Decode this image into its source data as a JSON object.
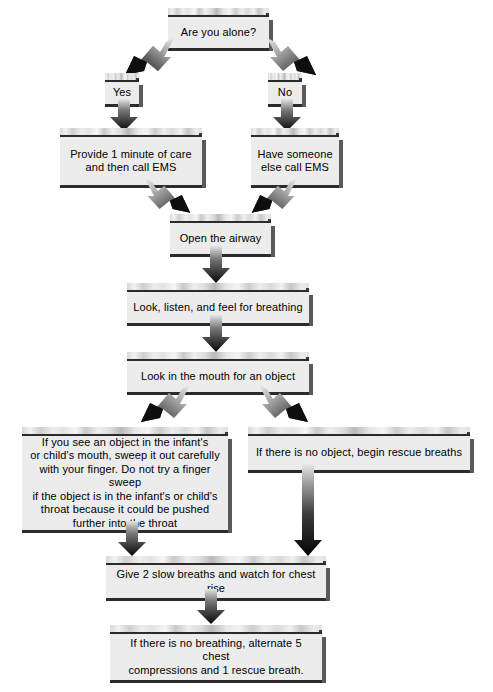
{
  "diagram": {
    "background_color": "#ffffff",
    "box_fill_color": "#ececec",
    "box_border_color": "#2b2b2b",
    "box_shadow_color": "#5a5a5a",
    "arrow_color": "#111111"
  },
  "nodes": {
    "are_you_alone": "Are you alone?",
    "yes": "Yes",
    "no": "No",
    "provide_care": "Provide 1 minute of care\nand then call EMS",
    "have_someone_call": "Have someone\nelse call EMS",
    "open_airway": "Open the airway",
    "look_listen_feel": "Look, listen, and feel for breathing",
    "look_in_mouth": "Look in the mouth for an object",
    "finger_sweep": "If you see an object in the infant's\nor child's mouth, sweep it out carefully\nwith your finger. Do not try a finger sweep\nif the object is in the infant's or child's\nthroat because it could be pushed\nfurther into the throat",
    "no_object": "If there is no object, begin rescue breaths",
    "two_slow_breaths": "Give 2 slow breaths and watch for chest rise",
    "no_breathing": "If there is no breathing, alternate 5 chest\ncompressions and 1 rescue breath."
  },
  "connectors": [
    {
      "name": "alone-to-yes",
      "kind": "diagonal-down-left"
    },
    {
      "name": "alone-to-no",
      "kind": "diagonal-down-right"
    },
    {
      "name": "yes-to-provide-care",
      "kind": "vertical-down"
    },
    {
      "name": "no-to-have-someone",
      "kind": "vertical-down"
    },
    {
      "name": "provide-care-to-open-airway",
      "kind": "diagonal-down-right"
    },
    {
      "name": "have-someone-to-open-airway",
      "kind": "diagonal-down-left"
    },
    {
      "name": "open-airway-to-look-listen",
      "kind": "vertical-down"
    },
    {
      "name": "look-listen-to-look-in-mouth",
      "kind": "vertical-down"
    },
    {
      "name": "look-in-mouth-to-finger-sweep",
      "kind": "diagonal-down-left"
    },
    {
      "name": "look-in-mouth-to-no-object",
      "kind": "diagonal-down-right"
    },
    {
      "name": "finger-sweep-to-two-breaths",
      "kind": "vertical-down"
    },
    {
      "name": "no-object-to-two-breaths",
      "kind": "vertical-down-long"
    },
    {
      "name": "two-breaths-to-no-breathing",
      "kind": "vertical-down"
    }
  ]
}
